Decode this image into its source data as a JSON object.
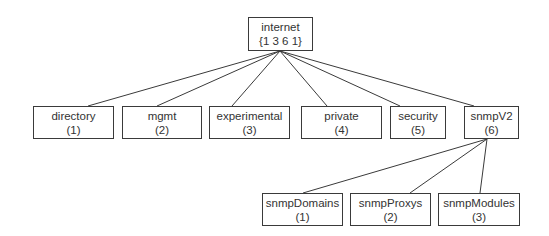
{
  "diagram": {
    "root": {
      "name": "internet",
      "oid": "{1 3 6 1}",
      "box": [
        248,
        17,
        65,
        34
      ]
    },
    "level1": [
      {
        "name": "directory",
        "oid": "(1)",
        "box": [
          33,
          106,
          81,
          33
        ]
      },
      {
        "name": "mgmt",
        "oid": "(2)",
        "box": [
          122,
          106,
          80,
          33
        ]
      },
      {
        "name": "experimental",
        "oid": "(3)",
        "box": [
          209,
          106,
          81,
          33
        ]
      },
      {
        "name": "private",
        "oid": "(4)",
        "box": [
          301,
          106,
          81,
          33
        ]
      },
      {
        "name": "security",
        "oid": "(5)",
        "box": [
          390,
          106,
          56,
          33
        ]
      },
      {
        "name": "snmpV2",
        "oid": "(6)",
        "box": [
          464,
          106,
          55,
          33
        ]
      }
    ],
    "snmpV2_children": [
      {
        "name": "snmpDomains",
        "oid": "(1)",
        "box": [
          262,
          193,
          81,
          33
        ]
      },
      {
        "name": "snmpProxys",
        "oid": "(2)",
        "box": [
          350,
          193,
          81,
          33
        ]
      },
      {
        "name": "snmpModules",
        "oid": "(3)",
        "box": [
          438,
          193,
          82,
          33
        ]
      }
    ],
    "colors": {
      "line": "#3a3a3a",
      "text": "#333333",
      "background": "#ffffff"
    }
  }
}
